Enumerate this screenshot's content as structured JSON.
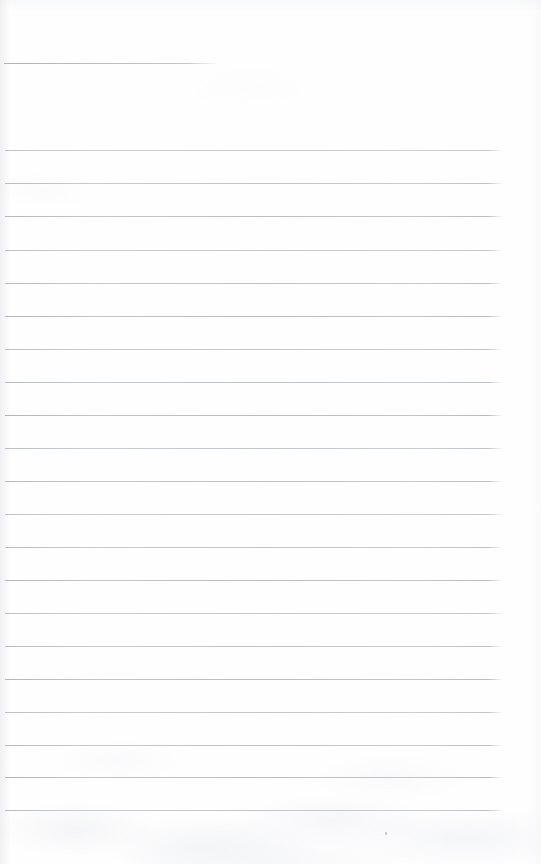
{
  "document": {
    "kind": "scanned-ruled-notebook-page",
    "title": "Blank ruled page",
    "page_width": 541,
    "page_height": 864,
    "background_color": "#fefefe",
    "rule_color": "#b9bdc2",
    "has_visible_text": false,
    "text_content": ""
  },
  "rules": {
    "partial_rule": {
      "label": "partial-top-rule",
      "y": 63,
      "x_start": 4,
      "x_end": 219,
      "length": 215
    },
    "full_rule_geometry": {
      "x_start": 5,
      "x_end": 503,
      "length": 498,
      "spacing": 33,
      "first_y": 150,
      "last_y": 810,
      "count": 21
    },
    "full_rule_positions": [
      150,
      183,
      216,
      250,
      283,
      316,
      349,
      382,
      415,
      448,
      481,
      514,
      547,
      580,
      613,
      646,
      679,
      712,
      745,
      777,
      810
    ]
  },
  "marks": {
    "speck": {
      "label": "scan-speck",
      "x": 385,
      "y": 832
    }
  },
  "margins": {
    "top_blank_height": 63,
    "bottom_blank_height": 54,
    "right_blank_width": 38
  }
}
